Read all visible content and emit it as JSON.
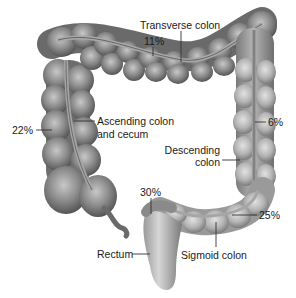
{
  "diagram": {
    "colors": {
      "tissue_dark": "#5f5f5f",
      "tissue_mid": "#8a8a8a",
      "tissue_light": "#c4c4c4",
      "band": "#a9a9a9",
      "leader_line": "#333333",
      "label_text": "#1a1a1a",
      "background": "#ffffff"
    },
    "segments": [
      {
        "id": "transverse",
        "label": "Transverse colon",
        "percent": "11%"
      },
      {
        "id": "ascending",
        "label_line1": "Ascending colon",
        "label_line2": "and cecum",
        "percent": "22%"
      },
      {
        "id": "descending",
        "label_line1": "Descending",
        "label_line2": "colon",
        "percent": "6%"
      },
      {
        "id": "rectum",
        "label": "Rectum",
        "percent": "30%"
      },
      {
        "id": "sigmoid",
        "label": "Sigmoid colon",
        "percent": "25%"
      }
    ]
  }
}
